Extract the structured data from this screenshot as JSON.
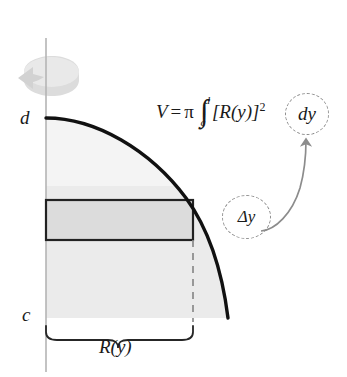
{
  "figure": {
    "name": "disk-method-volume-of-revolution-diagram",
    "axis": {
      "label_top": "d",
      "label_bottom": "c"
    },
    "radius_label": "R(y)",
    "formula": {
      "lhs": "V",
      "equals": "=",
      "pi": "π",
      "integral_sign": "∫",
      "upper_limit": "d",
      "lower_limit": "c",
      "integrand": "[R(y)]",
      "exponent": "2"
    },
    "annotations": {
      "dy": "dy",
      "delta_y": "Δy"
    },
    "icons": {
      "rotation": "rotation-arrow-icon",
      "pointer": "curved-arrow-icon"
    },
    "colors": {
      "region_fill": "#e8e8e8",
      "region_fill_light": "#f2f2f2",
      "strip_fill": "#d9d9d9",
      "curve_stroke": "#111111",
      "axis_stroke": "#b0b0b0",
      "dashed_stroke": "#8c8c8c",
      "rotation_icon": "#d5d5d5",
      "background": "#ffffff"
    }
  }
}
